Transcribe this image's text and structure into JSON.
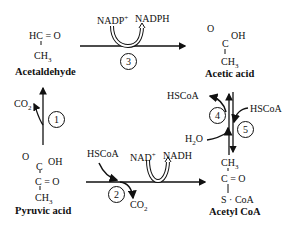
{
  "diagram": {
    "compounds": {
      "acetaldehyde": {
        "line1": "HC = O",
        "line2": "CH",
        "sub2": "3",
        "name": "Acetaldehyde"
      },
      "acetic_acid": {
        "o": "O",
        "oh": "OH",
        "c": "C",
        "ch": "CH",
        "sub": "3",
        "name": "Acetic acid"
      },
      "pyruvic_acid": {
        "o": "O",
        "oh": "OH",
        "c1": "C",
        "c2": "C = O",
        "ch": "CH",
        "sub": "3",
        "name": "Pyruvic acid"
      },
      "acetyl_coa": {
        "ch": "CH",
        "sub": "3",
        "co": "C = O",
        "scoa": "S · CoA",
        "name": "Acetyl CoA"
      }
    },
    "reactions": {
      "r1": {
        "number": "1",
        "product": "CO",
        "product_sub": "2"
      },
      "r2": {
        "number": "2",
        "reactant": "HSCoA",
        "cofactor_in": "NAD",
        "cofactor_in_sup": "+",
        "cofactor_out": "NADH",
        "product": "CO",
        "product_sub": "2"
      },
      "r3": {
        "number": "3",
        "cofactor_in": "NADP",
        "cofactor_in_sup": "+",
        "cofactor_out": "NADPH"
      },
      "r4": {
        "number": "4",
        "reactant": "H",
        "reactant_sub": "2",
        "reactant_rest": "O",
        "product": "HSCoA"
      },
      "r5": {
        "number": "5",
        "reactant": "HSCoA"
      }
    }
  }
}
